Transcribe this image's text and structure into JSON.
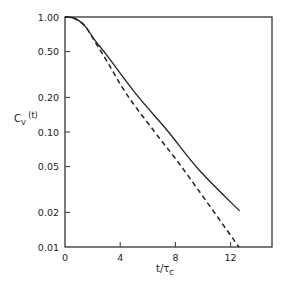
{
  "chart_data": {
    "type": "line",
    "title": "",
    "xlabel": "t/τ_C",
    "ylabel": "C_V (t)",
    "xscale": "linear",
    "yscale": "log",
    "xlim": [
      0,
      15
    ],
    "ylim": [
      0.01,
      1.0
    ],
    "grid": false,
    "legend": null,
    "x_ticks": [
      0,
      4,
      8,
      12
    ],
    "x_tick_labels": [
      "0",
      "4",
      "8",
      "12"
    ],
    "y_ticks": [
      1.0,
      0.5,
      0.2,
      0.1,
      0.05,
      0.02,
      0.01
    ],
    "y_tick_labels": [
      "1.00",
      "0.50",
      "0.20",
      "0.10",
      "0.05",
      "0.02",
      "0.01"
    ],
    "series": [
      {
        "name": "solid",
        "style": "solid",
        "x": [
          0,
          0.5,
          1.0,
          1.5,
          2.2,
          3.0,
          5.2,
          7.5,
          9.7,
          12.65
        ],
        "y": [
          1.0,
          0.99,
          0.93,
          0.82,
          0.62,
          0.47,
          0.21,
          0.1,
          0.047,
          0.0206
        ]
      },
      {
        "name": "dashed",
        "style": "dashed",
        "x": [
          0,
          0.5,
          1.0,
          1.5,
          2.2,
          3.0,
          4.5,
          6.5,
          8.6,
          12.6
        ],
        "y": [
          1.0,
          0.99,
          0.93,
          0.82,
          0.6,
          0.42,
          0.21,
          0.1,
          0.047,
          0.01
        ]
      }
    ]
  },
  "labels": {
    "y_main": "C",
    "y_sub": "V",
    "y_arg": " (t)",
    "x_main": "t/τ",
    "x_sub": "C"
  }
}
